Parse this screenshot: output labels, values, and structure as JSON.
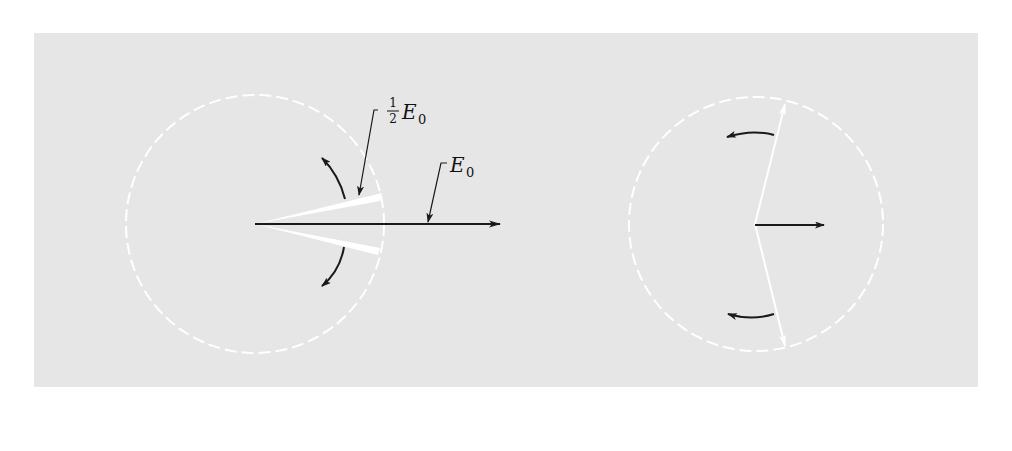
{
  "diagram": {
    "colors": {
      "background": "#e6e6e6",
      "page": "#ffffff",
      "circle": "#ffffff",
      "phasor": "#ffffff",
      "resultant": "#1a1a1a",
      "rotation_arrow": "#1a1a1a"
    },
    "left": {
      "labels": {
        "half_fraction_num": "1",
        "half_fraction_den": "2",
        "half_symbol": "E",
        "half_subscript": "0",
        "resultant_symbol": "E",
        "resultant_subscript": "0"
      }
    },
    "right": {}
  }
}
